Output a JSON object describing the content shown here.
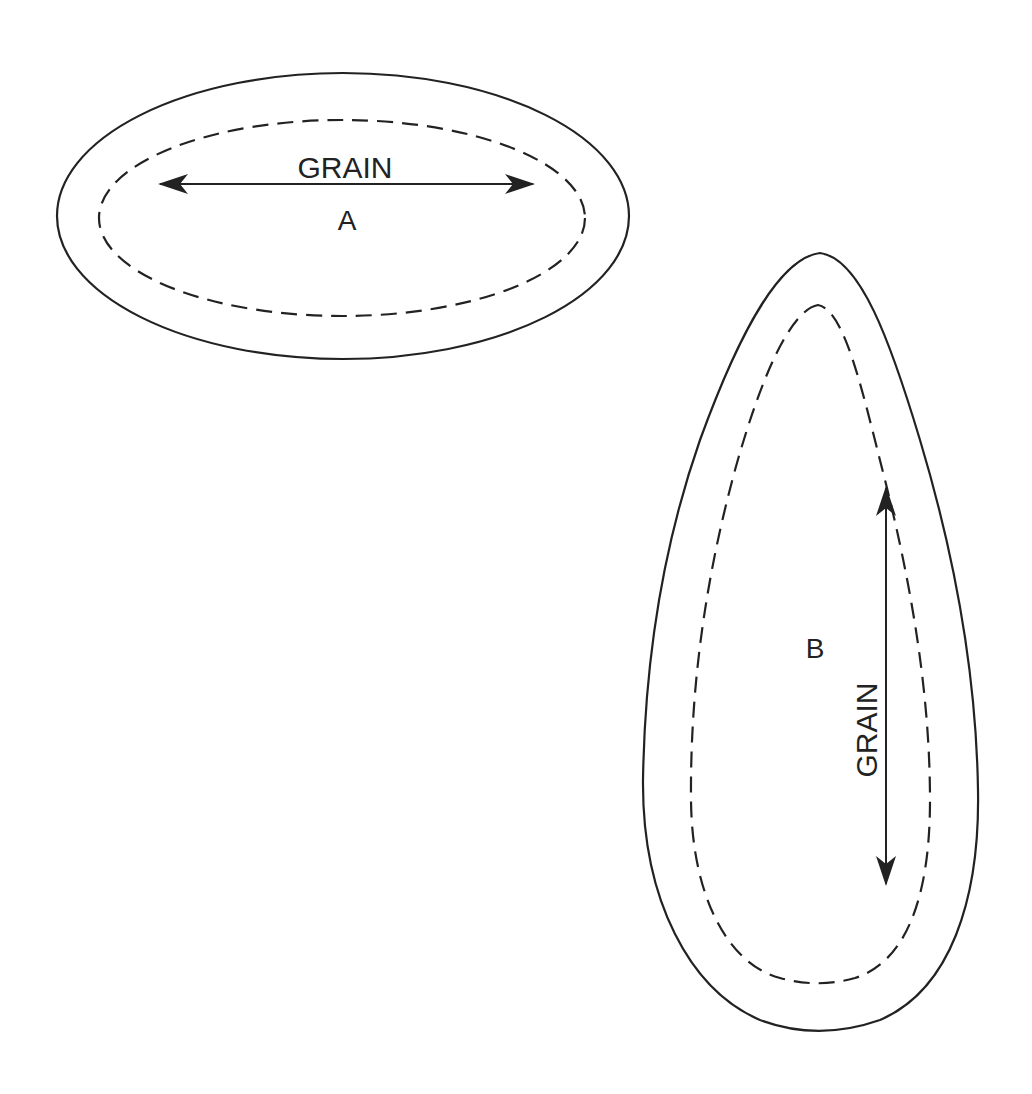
{
  "diagram": {
    "colors": {
      "stroke": "#222222",
      "background": "#ffffff"
    },
    "pieces": [
      {
        "id": "A",
        "label": "A",
        "shape": "ellipse",
        "outline": "cutting-line-solid",
        "inner_outline": "seam-line-dashed",
        "grain": {
          "label": "GRAIN",
          "orientation": "horizontal"
        }
      },
      {
        "id": "B",
        "label": "B",
        "shape": "teardrop",
        "outline": "cutting-line-solid",
        "inner_outline": "seam-line-dashed",
        "grain": {
          "label": "GRAIN",
          "orientation": "vertical"
        }
      }
    ]
  }
}
